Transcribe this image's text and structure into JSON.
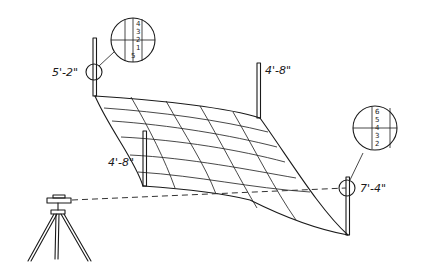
{
  "diagram": {
    "colors": {
      "ink": "#1a1a1a",
      "paper": "#ffffff"
    },
    "rod_labels": {
      "top_left": "5'-2\"",
      "top_right": "4'-8\"",
      "middle_left": "4'-8\"",
      "bottom_right": "7'-4\""
    },
    "detail_left": {
      "ticks": [
        "4",
        "3",
        "2",
        "1",
        "5"
      ]
    },
    "detail_right": {
      "ticks": [
        "6",
        "5",
        "4",
        "3",
        "2"
      ]
    },
    "instrument": "level-on-tripod-icon"
  }
}
